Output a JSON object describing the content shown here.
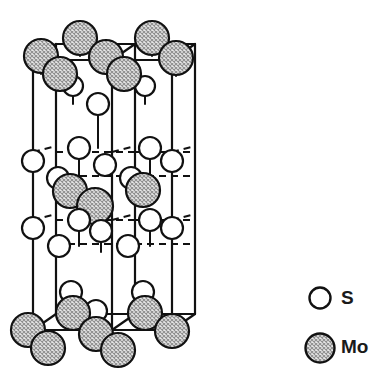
{
  "figure": {
    "kind": "crystal-structure-unit-cell",
    "compound": "MoS2",
    "projection": "oblique",
    "title": ""
  },
  "legend": {
    "position": "right",
    "entries": [
      {
        "key": "S",
        "label": "S",
        "marker": "open-circle",
        "radius": 10.5,
        "fill": "#ffffff",
        "stroke": "#111111"
      },
      {
        "key": "Mo",
        "label": "Mo",
        "marker": "hatched-circle",
        "radius": 14.5,
        "fill": "#d2d2d2",
        "stroke": "#111111"
      }
    ],
    "s_marker": {
      "cx": 320,
      "cy": 298
    },
    "mo_marker": {
      "cx": 320,
      "cy": 348
    }
  },
  "style": {
    "edge_color": "#111111",
    "edge_width": 2.2,
    "bond_color": "#111111",
    "bond_width": 2.0,
    "hidden_edge_dash": "7,5",
    "atom_outline": "#111111",
    "atom_outline_width": 2.2,
    "mo_fill": "#d2d2d2",
    "s_fill": "#ffffff",
    "background": "#ffffff"
  },
  "cell": {
    "comment": "oblique-projection prism: front face corners and back face corners (screen px)",
    "front": {
      "left_x": 33,
      "right_x": 112,
      "top_y": 60,
      "bottom_y": 330
    },
    "back": {
      "left_x": 56,
      "right_x": 135,
      "top_y": 44,
      "bottom_y": 314
    },
    "outer_right": {
      "x": 172,
      "top_y": 60,
      "bottom_y": 330
    },
    "outer_right_back": {
      "x": 195,
      "top_y": 44,
      "bottom_y": 314
    },
    "height_px": 270,
    "vertical_edges_x": [
      33,
      56,
      112,
      135,
      172,
      195
    ],
    "horizontal_levels_y": [
      44,
      60,
      314,
      330
    ]
  },
  "atoms": {
    "mo": [
      {
        "cx": 41,
        "cy": 56,
        "r": 17,
        "layer": "top"
      },
      {
        "cx": 60,
        "cy": 74,
        "r": 17,
        "layer": "top"
      },
      {
        "cx": 80,
        "cy": 38,
        "r": 17,
        "layer": "top"
      },
      {
        "cx": 106,
        "cy": 57,
        "r": 17,
        "layer": "top"
      },
      {
        "cx": 124,
        "cy": 74,
        "r": 17,
        "layer": "top"
      },
      {
        "cx": 152,
        "cy": 38,
        "r": 17,
        "layer": "top"
      },
      {
        "cx": 176,
        "cy": 58,
        "r": 17,
        "layer": "top"
      },
      {
        "cx": 70,
        "cy": 191,
        "r": 17,
        "layer": "middle"
      },
      {
        "cx": 95,
        "cy": 206,
        "r": 18,
        "layer": "middle"
      },
      {
        "cx": 143,
        "cy": 190,
        "r": 17,
        "layer": "middle"
      },
      {
        "cx": 28,
        "cy": 330,
        "r": 17,
        "layer": "bottom"
      },
      {
        "cx": 48,
        "cy": 348,
        "r": 17,
        "layer": "bottom"
      },
      {
        "cx": 73,
        "cy": 313,
        "r": 17,
        "layer": "bottom"
      },
      {
        "cx": 96,
        "cy": 334,
        "r": 17,
        "layer": "bottom"
      },
      {
        "cx": 118,
        "cy": 350,
        "r": 17,
        "layer": "bottom"
      },
      {
        "cx": 145,
        "cy": 313,
        "r": 17,
        "layer": "bottom"
      },
      {
        "cx": 172,
        "cy": 331,
        "r": 17,
        "layer": "bottom"
      }
    ],
    "s": [
      {
        "cx": 73,
        "cy": 86,
        "r": 10,
        "layer": "upper-inner"
      },
      {
        "cx": 145,
        "cy": 86,
        "r": 10,
        "layer": "upper-inner"
      },
      {
        "cx": 98,
        "cy": 104,
        "r": 11,
        "layer": "upper-center"
      },
      {
        "cx": 33,
        "cy": 161,
        "r": 11,
        "layer": "front-left-edge"
      },
      {
        "cx": 79,
        "cy": 148,
        "r": 11,
        "layer": "inner"
      },
      {
        "cx": 105,
        "cy": 165,
        "r": 11,
        "layer": "inner"
      },
      {
        "cx": 150,
        "cy": 148,
        "r": 11,
        "layer": "inner"
      },
      {
        "cx": 172,
        "cy": 161,
        "r": 11,
        "layer": "front-right-edge"
      },
      {
        "cx": 58,
        "cy": 178,
        "r": 11,
        "layer": "inner"
      },
      {
        "cx": 131,
        "cy": 178,
        "r": 11,
        "layer": "inner"
      },
      {
        "cx": 79,
        "cy": 220,
        "r": 11,
        "layer": "inner"
      },
      {
        "cx": 150,
        "cy": 220,
        "r": 11,
        "layer": "inner"
      },
      {
        "cx": 33,
        "cy": 228,
        "r": 11,
        "layer": "front-left-edge"
      },
      {
        "cx": 101,
        "cy": 231,
        "r": 11,
        "layer": "inner"
      },
      {
        "cx": 172,
        "cy": 228,
        "r": 11,
        "layer": "front-right-edge"
      },
      {
        "cx": 59,
        "cy": 246,
        "r": 11,
        "layer": "inner"
      },
      {
        "cx": 128,
        "cy": 246,
        "r": 11,
        "layer": "inner"
      },
      {
        "cx": 71,
        "cy": 292,
        "r": 11,
        "layer": "lower-inner"
      },
      {
        "cx": 143,
        "cy": 292,
        "r": 11,
        "layer": "lower-inner"
      },
      {
        "cx": 96,
        "cy": 311,
        "r": 11,
        "layer": "lower-center"
      }
    ]
  }
}
